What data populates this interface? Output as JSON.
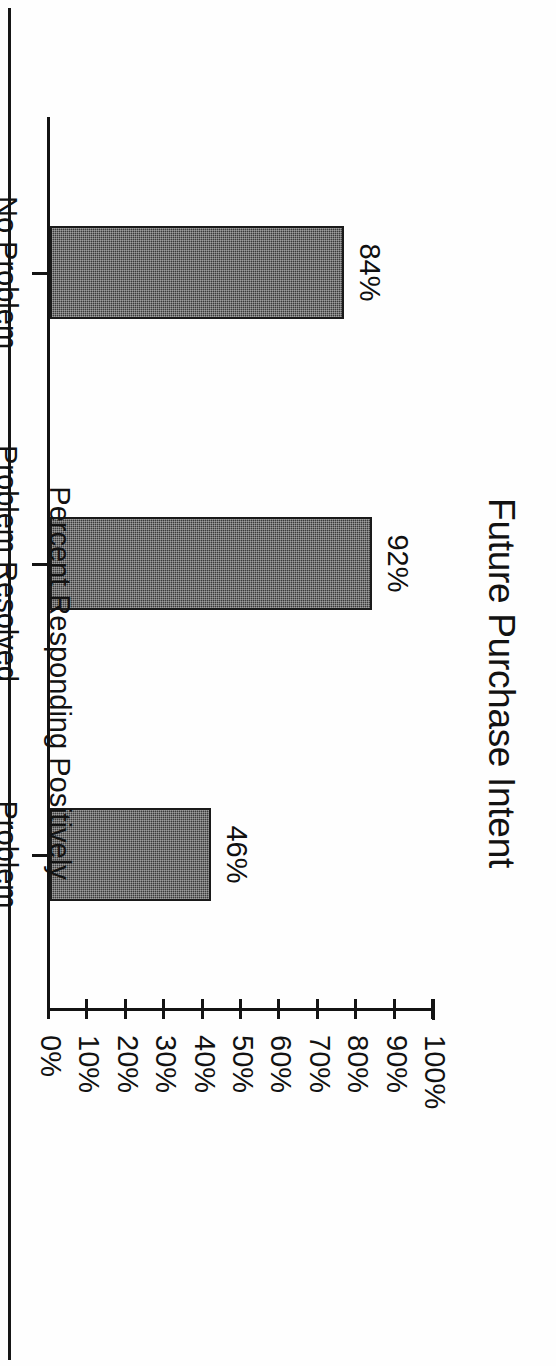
{
  "chart_data": {
    "type": "bar",
    "title": "Future Purchase Intent",
    "xlabel": "",
    "ylabel": "Percent Responding Positively",
    "orientation": "vertical-bars-rotated-90cw",
    "categories": [
      "No Problem",
      "Problem Resolved\nSatisfactorily",
      "Problem Unresolved"
    ],
    "values": [
      84,
      92,
      46
    ],
    "value_labels": [
      "84%",
      "92%",
      "46%"
    ],
    "ylim": [
      0,
      100
    ],
    "ytick_values": [
      0,
      10,
      20,
      30,
      40,
      50,
      60,
      70,
      80,
      90,
      100
    ],
    "ytick_labels": [
      "0%",
      "10%",
      "20%",
      "30%",
      "40%",
      "50%",
      "60%",
      "70%",
      "80%",
      "90%",
      "100%"
    ],
    "grid": false,
    "legend": false,
    "colors": {
      "bar_fill": "#3a3a3a",
      "bar_stroke": "#1a1a1a",
      "axis": "#131313",
      "text": "#121212",
      "background": "#fefefe"
    }
  },
  "page": {
    "rule": "page-edge-rule"
  }
}
